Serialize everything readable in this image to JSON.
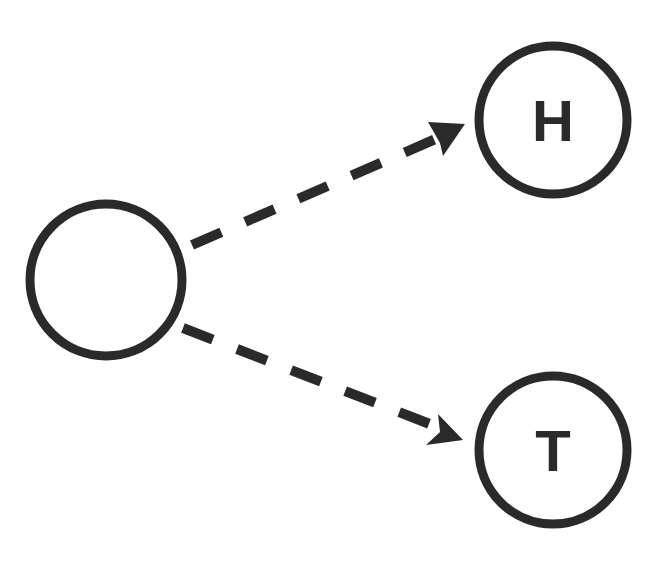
{
  "diagram": {
    "type": "probability-tree",
    "colors": {
      "stroke": "#2a2a2a",
      "background": "#ffffff"
    },
    "nodes": [
      {
        "id": "root",
        "label": "",
        "cx": 106,
        "cy": 280,
        "r": 76
      },
      {
        "id": "heads",
        "label": "H",
        "cx": 553,
        "cy": 120,
        "r": 74
      },
      {
        "id": "tails",
        "label": "T",
        "cx": 553,
        "cy": 450,
        "r": 74
      }
    ],
    "edges": [
      {
        "from": "root",
        "to": "heads",
        "style": "dashed-arrow"
      },
      {
        "from": "root",
        "to": "tails",
        "style": "dashed-arrow"
      }
    ]
  }
}
